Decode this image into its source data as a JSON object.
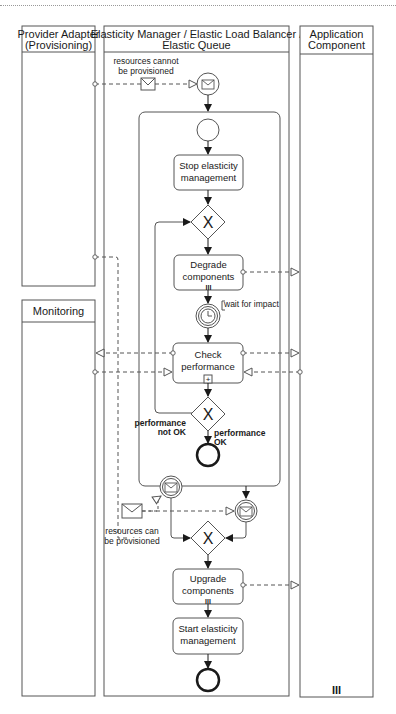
{
  "lanes": {
    "provider_adapter": "Provider Adapter (Provisioning)",
    "provider_adapter_l1": "Provider Adapter",
    "provider_adapter_l2": "(Provisioning)",
    "elasticity_manager_l1": "Elasticity Manager / Elastic Load Balancer /",
    "elasticity_manager_l2": "Elastic Queue",
    "application_component_l1": "Application",
    "application_component_l2": "Component",
    "monitoring": "Monitoring"
  },
  "messages": {
    "cannot_provision_l1": "resources cannot",
    "cannot_provision_l2": "be provisioned",
    "can_provision_l1": "resources can",
    "can_provision_l2": "be provisioned"
  },
  "tasks": {
    "stop_l1": "Stop elasticity",
    "stop_l2": "management",
    "degrade_l1": "Degrade",
    "degrade_l2": "components",
    "check_l1": "Check",
    "check_l2": "performance",
    "upgrade_l1": "Upgrade",
    "upgrade_l2": "components",
    "start_l1": "Start elasticity",
    "start_l2": "management"
  },
  "annotations": {
    "wait": "wait for impact"
  },
  "gateway_labels": {
    "not_ok_l1": "performance",
    "not_ok_l2": "not OK",
    "ok_l1": "performance",
    "ok_l2": "OK"
  },
  "markers": {
    "multi_instance": "III",
    "subprocess": "+"
  },
  "colors": {
    "stroke": "#3a3a3a",
    "background": "#ffffff",
    "task_fill": "#ffffff"
  }
}
